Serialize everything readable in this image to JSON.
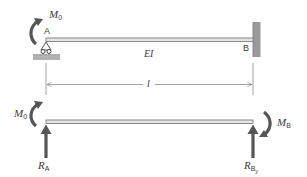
{
  "figure": {
    "top_diagram": {
      "moment_label": "M",
      "moment_sub": "0",
      "point_a": "A",
      "point_b": "B",
      "stiffness_label": "EI",
      "length_label": "l",
      "support_a": "pin-support",
      "support_b": "fixed-wall"
    },
    "bottom_diagram": {
      "moment_left_label": "M",
      "moment_left_sub": "0",
      "moment_right_label": "M",
      "moment_right_sub": "B",
      "reaction_a_label": "R",
      "reaction_a_sub": "A",
      "reaction_b_label": "R",
      "reaction_b_sub": "B",
      "reaction_b_subsub": "y"
    },
    "colors": {
      "beam_fill": "#e6e6e6",
      "beam_stroke": "#6e6e6e",
      "arrow": "#555555",
      "wall": "#9a9a9a",
      "ground": "#a8a8a8",
      "text": "#3a3a3a",
      "dimension": "#8a8a8a"
    }
  }
}
